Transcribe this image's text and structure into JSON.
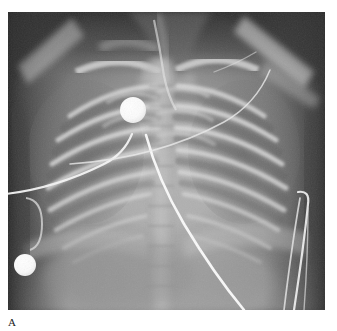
{
  "figure": {
    "panel_label": "A",
    "caption_fragment_left": "",
    "caption_fragment_right": "",
    "modality": "chest-radiograph",
    "view": "anteroposterior"
  },
  "plate": {
    "left": 8,
    "top": 12,
    "width": 317,
    "height": 298,
    "background_color": "#6e6e6e",
    "border_color": "#ffffff"
  },
  "anatomy": {
    "lung_field_color": "#7c7c7c",
    "soft_tissue_color": "#8d8d8d",
    "bone_color": "#d8d8d8",
    "mediastinum_color": "#b4b4b4",
    "abdomen_color": "#9a9a9a",
    "background_dark_color": "#3a3a3a",
    "spine_label": "thoracic-spine",
    "ribs_left_count": 8,
    "ribs_right_count": 8,
    "clavicle_label": "clavicle",
    "diaphragm_label": "diaphragm"
  },
  "devices": {
    "electrodes": [
      {
        "name": "ecg-electrode-upper",
        "cx": 133,
        "cy": 110,
        "r": 13,
        "color": "#fdfdfd"
      },
      {
        "name": "ecg-electrode-lower",
        "cx": 25,
        "cy": 265,
        "r": 11,
        "color": "#fdfdfd"
      }
    ],
    "lead_wires": [
      {
        "name": "lead-wire-upper-left",
        "color": "#f4f4f4"
      },
      {
        "name": "lead-wire-central",
        "color": "#f8f8f8"
      },
      {
        "name": "lead-wire-right-1",
        "color": "#f4f4f4"
      },
      {
        "name": "lead-wire-right-2",
        "color": "#f0f0f0"
      },
      {
        "name": "lead-wire-right-3",
        "color": "#efefef"
      }
    ],
    "tubes": [
      {
        "name": "endotracheal-tube",
        "color": "#e6e6e6"
      }
    ]
  }
}
